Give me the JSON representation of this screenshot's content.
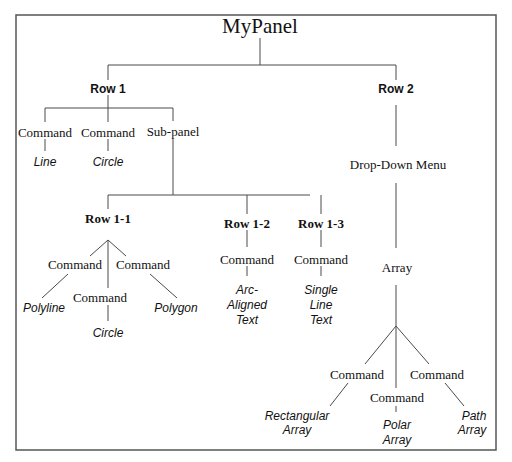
{
  "title": "MyPanel",
  "rows": {
    "row1": {
      "label": "Row 1",
      "children": [
        {
          "type": "Command",
          "leaf": "Line"
        },
        {
          "type": "Command",
          "leaf": "Circle"
        },
        {
          "type": "Sub-panel"
        }
      ],
      "subpanel": {
        "label": "Sub-panel",
        "rows": [
          {
            "label": "Row 1-1",
            "commands": [
              {
                "type": "Command",
                "leaf": "Polyline"
              },
              {
                "type": "Command",
                "leaf": "Circle"
              },
              {
                "type": "Command",
                "leaf": "Polygon"
              }
            ]
          },
          {
            "label": "Row 1-2",
            "commands": [
              {
                "type": "Command",
                "leaf_lines": [
                  "Arc-",
                  "Aligned",
                  "Text"
                ]
              }
            ]
          },
          {
            "label": "Row 1-3",
            "commands": [
              {
                "type": "Command",
                "leaf_lines": [
                  "Single",
                  "Line",
                  "Text"
                ]
              }
            ]
          }
        ]
      }
    },
    "row2": {
      "label": "Row 2",
      "dropdown": "Drop-Down Menu",
      "array": "Array",
      "commands": [
        {
          "type": "Command",
          "leaf_lines": [
            "Rectangular",
            "Array"
          ]
        },
        {
          "type": "Command",
          "leaf_lines": [
            "Polar",
            "Array"
          ]
        },
        {
          "type": "Command",
          "leaf_lines": [
            "Path",
            "Array"
          ]
        }
      ]
    }
  }
}
